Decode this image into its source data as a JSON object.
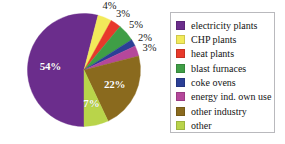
{
  "chart_data": {
    "type": "pie",
    "title": "",
    "legend_position": "right",
    "categories": [
      "electricity plants",
      "CHP plants",
      "heat plants",
      "blast furnaces",
      "coke ovens",
      "energy ind. own use",
      "other industry",
      "other"
    ],
    "values": [
      54,
      4,
      3,
      5,
      2,
      3,
      22,
      7
    ],
    "value_labels": [
      "54%",
      "4%",
      "3%",
      "5%",
      "2%",
      "3%",
      "22%",
      "7%"
    ],
    "colors": [
      "#6b2d8c",
      "#f2ea5a",
      "#e8392b",
      "#3f9e46",
      "#2b3f96",
      "#b5479b",
      "#8a6a1e",
      "#b9d44a"
    ],
    "label_placement": [
      "inside",
      "outside",
      "outside",
      "outside",
      "outside",
      "outside",
      "inside",
      "inside"
    ],
    "inside_label_color": "#ffffff",
    "outside_label_color": "#1a1a1a"
  },
  "legend": {
    "items": [
      {
        "label": "electricity plants",
        "color": "#6b2d8c"
      },
      {
        "label": "CHP plants",
        "color": "#f2ea5a"
      },
      {
        "label": "heat plants",
        "color": "#e8392b"
      },
      {
        "label": "blast furnaces",
        "color": "#3f9e46"
      },
      {
        "label": "coke ovens",
        "color": "#2b3f96"
      },
      {
        "label": "energy ind. own use",
        "color": "#b5479b"
      },
      {
        "label": "other industry",
        "color": "#8a6a1e"
      },
      {
        "label": "other",
        "color": "#b9d44a"
      }
    ]
  }
}
